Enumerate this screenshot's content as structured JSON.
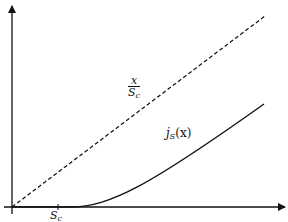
{
  "diagram": {
    "type": "function plot sketch",
    "axes": {
      "x_axis": "horizontal arrow",
      "y_axis": "vertical arrow"
    },
    "tick_label": {
      "main": "S",
      "sub": "c"
    },
    "dashed_line_label": {
      "numerator": "x",
      "denominator_main": "S",
      "denominator_sub": "c"
    },
    "curve_label": {
      "main": "j",
      "sub": "S",
      "arg": "(x)"
    },
    "colors": {
      "line": "#111111",
      "background": "#ffffff"
    }
  }
}
